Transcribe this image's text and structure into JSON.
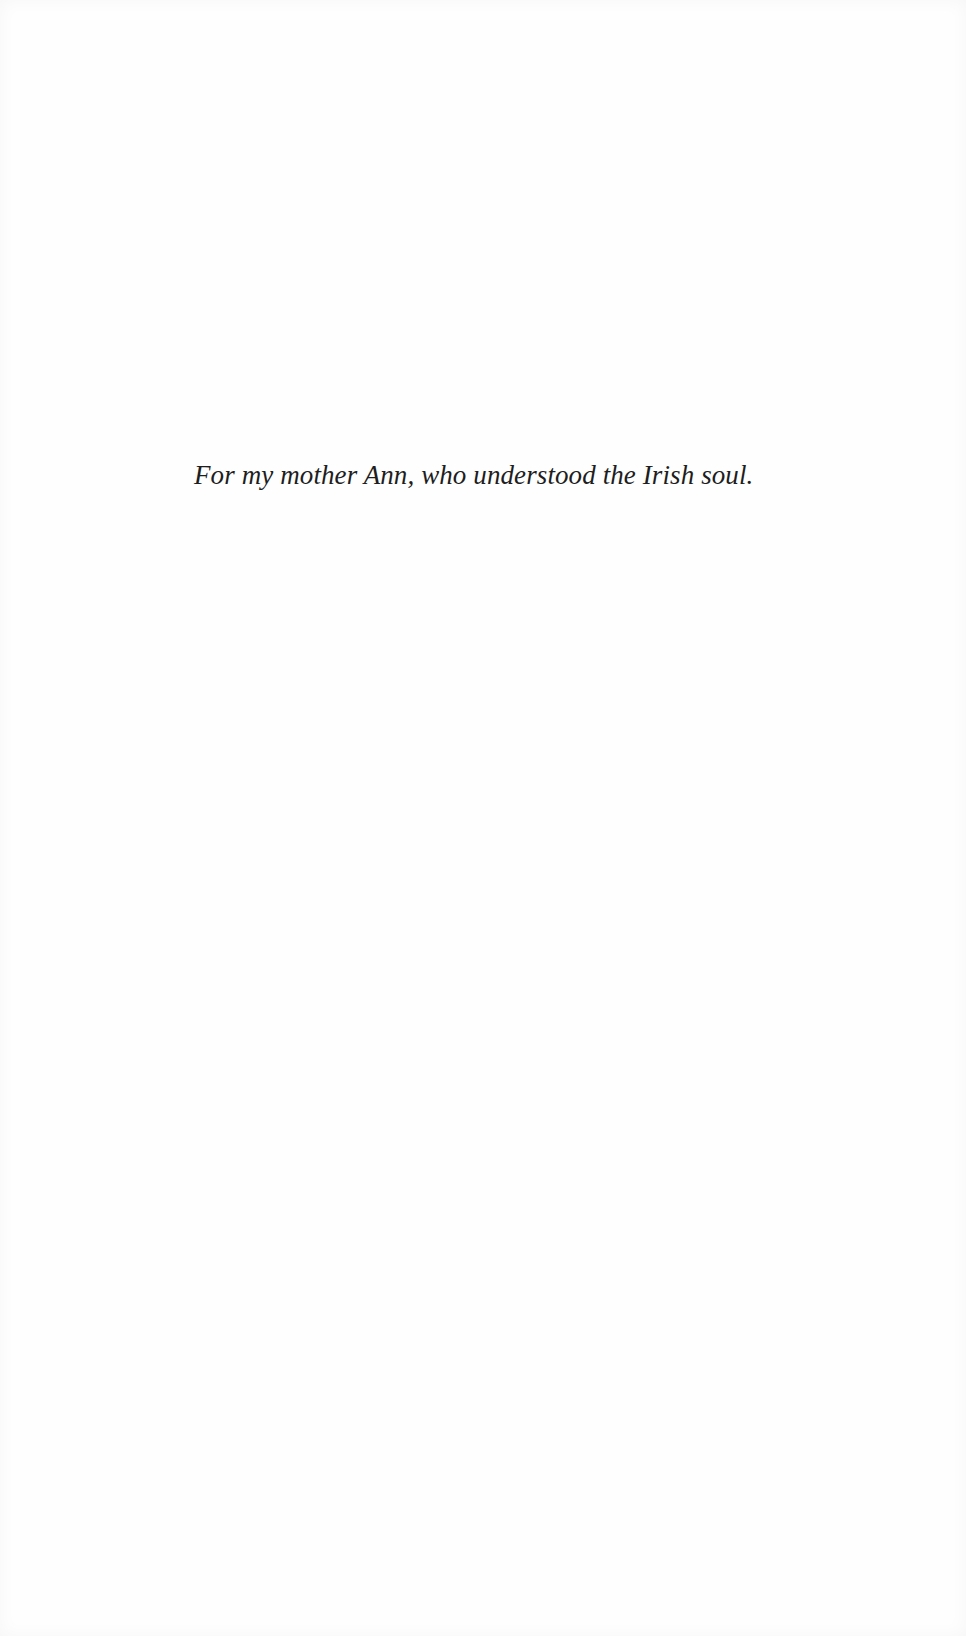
{
  "page": {
    "dedication": "For my mother Ann, who understood the Irish soul."
  }
}
